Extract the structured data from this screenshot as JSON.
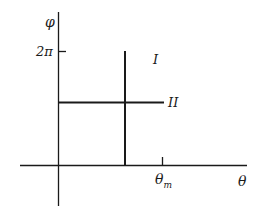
{
  "diagram": {
    "axes": {
      "y_label": "φ",
      "x_label": "θ"
    },
    "ticks": {
      "y_tick_label": "2π",
      "x_tick_label_main": "θ",
      "x_tick_label_sub": "m"
    },
    "lines": [
      {
        "id": "I",
        "label": "I",
        "orientation": "vertical",
        "description": "line at constant θ spanning φ from 0 to 2π"
      },
      {
        "id": "II",
        "label": "II",
        "orientation": "horizontal",
        "description": "line at constant φ spanning θ from 0 to θm"
      }
    ],
    "colors": {
      "stroke": "#1a1a1a",
      "background": "#ffffff"
    }
  }
}
